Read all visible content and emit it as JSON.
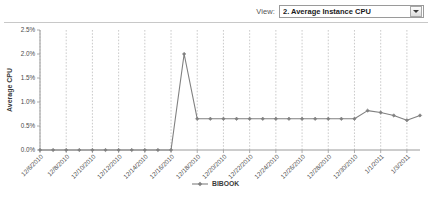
{
  "header": {
    "view_label": "View:",
    "selected_view": "2. Average Instance CPU",
    "dropdown_icon": "chevron-down-icon"
  },
  "chart_data": {
    "type": "line",
    "title": "",
    "xlabel": "",
    "ylabel": "Average CPU",
    "ylim": [
      0,
      2.5
    ],
    "ytick_labels": [
      "0.0%",
      "0.5%",
      "1.0%",
      "1.5%",
      "2.0%",
      "2.5%"
    ],
    "ytick_values": [
      0,
      0.5,
      1.0,
      1.5,
      2.0,
      2.5
    ],
    "grid": "vertical-dashed",
    "legend_position": "bottom-center",
    "series": [
      {
        "name": "BIBOOK",
        "color": "#808080",
        "marker": "diamond",
        "values": [
          0.0,
          0.0,
          0.0,
          0.0,
          0.0,
          0.0,
          0.0,
          0.0,
          0.0,
          0.0,
          0.0,
          2.0,
          0.65,
          0.65,
          0.65,
          0.65,
          0.65,
          0.65,
          0.65,
          0.65,
          0.65,
          0.65,
          0.65,
          0.65,
          0.65,
          0.82,
          0.78,
          0.72,
          0.62,
          0.72
        ]
      }
    ],
    "x": [
      "12/06/2010",
      "12/07/2010",
      "12/08/2010",
      "12/09/2010",
      "12/10/2010",
      "12/11/2010",
      "12/12/2010",
      "12/13/2010",
      "12/14/2010",
      "12/15/2010",
      "12/16/2010",
      "12/17/2010",
      "12/18/2010",
      "12/19/2010",
      "12/20/2010",
      "12/21/2010",
      "12/22/2010",
      "12/23/2010",
      "12/24/2010",
      "12/25/2010",
      "12/26/2010",
      "12/27/2010",
      "12/28/2010",
      "12/29/2010",
      "12/30/2010",
      "12/31/2010",
      "1/1/2011",
      "1/2/2011",
      "1/3/2011",
      "1/4/2011"
    ],
    "xtick_labels": [
      "12/6/2010",
      "12/8/2010",
      "12/10/2010",
      "12/12/2010",
      "12/14/2010",
      "12/16/2010",
      "12/18/2010",
      "12/20/2010",
      "12/22/2010",
      "12/24/2010",
      "12/26/2010",
      "12/28/2010",
      "12/30/2010",
      "1/1/2011",
      "1/3/2011"
    ],
    "legend": [
      "BIBOOK"
    ]
  }
}
